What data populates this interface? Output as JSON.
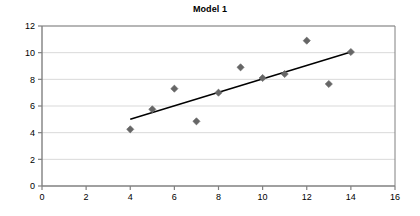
{
  "chart_data": {
    "type": "scatter",
    "title": "Model 1",
    "xlabel": "",
    "ylabel": "",
    "xlim": [
      0,
      16
    ],
    "ylim": [
      0,
      12
    ],
    "xticks": [
      0,
      2,
      4,
      6,
      8,
      10,
      12,
      14,
      16
    ],
    "yticks": [
      0,
      2,
      4,
      6,
      8,
      10,
      12
    ],
    "grid": "horizontal",
    "legend": "none",
    "series": [
      {
        "name": "observations",
        "marker": "diamond",
        "color": "#666666",
        "x": [
          4,
          5,
          6,
          7,
          8,
          9,
          10,
          11,
          12,
          13,
          14
        ],
        "values": [
          4.25,
          5.75,
          7.3,
          4.85,
          7.0,
          8.9,
          8.1,
          8.4,
          10.9,
          7.65,
          10.05
        ],
        "points": [
          {
            "x": 4,
            "y": 4.25
          },
          {
            "x": 5,
            "y": 5.75
          },
          {
            "x": 6,
            "y": 7.3
          },
          {
            "x": 7,
            "y": 4.85
          },
          {
            "x": 8,
            "y": 7.0
          },
          {
            "x": 9,
            "y": 8.9
          },
          {
            "x": 10,
            "y": 8.1
          },
          {
            "x": 11,
            "y": 8.4
          },
          {
            "x": 12,
            "y": 10.9
          },
          {
            "x": 13,
            "y": 7.65
          },
          {
            "x": 14,
            "y": 10.05
          }
        ]
      },
      {
        "name": "trendline",
        "marker": "none",
        "color": "#000000",
        "x": [
          4,
          14
        ],
        "values": [
          5.0,
          10.05
        ],
        "points": [
          {
            "x": 4,
            "y": 5.0
          },
          {
            "x": 14,
            "y": 10.05
          }
        ]
      }
    ],
    "colors": {
      "marker": "#666666",
      "trendline": "#000000",
      "axis": "#808080",
      "gridline": "#d9d9d9",
      "background": "#ffffff",
      "text": "#000000"
    }
  }
}
